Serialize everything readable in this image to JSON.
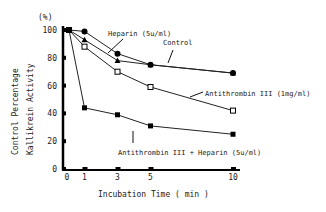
{
  "chart_data": {
    "type": "line",
    "title": "",
    "xlabel": "Incubation Time ( min )",
    "ylabel": "Control Percentage Kallikrein Activity",
    "ylabel_line1": "Control Percentage",
    "ylabel_line2": "Kallikrein Activity",
    "yunit": "(%)",
    "xlim": [
      0,
      10
    ],
    "ylim": [
      0,
      100
    ],
    "xticks": [
      0,
      1,
      3,
      5,
      10
    ],
    "yticks": [
      0,
      20,
      40,
      60,
      80,
      100
    ],
    "grid": false,
    "x": [
      0,
      1,
      3,
      5,
      10
    ],
    "series": [
      {
        "name": "Heparin (5u/ml)",
        "marker": "filled-circle",
        "values": [
          100,
          99,
          83,
          75,
          69
        ]
      },
      {
        "name": "Control",
        "marker": "filled-triangle",
        "values": [
          100,
          93,
          78,
          75,
          69
        ]
      },
      {
        "name": "Antithrombin III (1mg/ml)",
        "marker": "open-square",
        "values": [
          100,
          88,
          70,
          59,
          42
        ]
      },
      {
        "name": "Antithrombin III + Heparin (5u/ml)",
        "marker": "filled-square",
        "values": [
          100,
          44,
          39,
          31,
          25
        ]
      }
    ],
    "annotations": [
      {
        "text": "Heparin (5u/ml)"
      },
      {
        "text": "Control"
      },
      {
        "text": "Antithrombin III (1mg/ml)"
      },
      {
        "text": "Antithrombin III + Heparin (5u/ml)"
      }
    ]
  }
}
